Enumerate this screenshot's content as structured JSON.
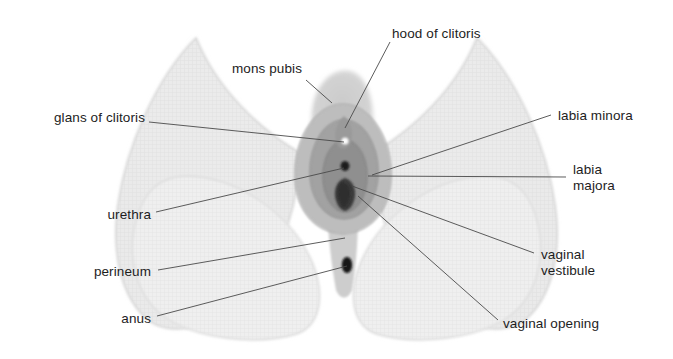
{
  "figure": {
    "width": 673,
    "height": 359,
    "background_color": "#ffffff",
    "text_color": "#1d1d1d",
    "leader_line_color": "#4a4a4a"
  },
  "palette": {
    "page_background": "#ffffff",
    "thigh_fill": "#e9e9e9",
    "thigh_edge": "#d2d2d2",
    "buttock_fill": "#ededed",
    "mons_fill": "#d0d0d0",
    "labia_majora_fill": "#bdbdbd",
    "labia_minora_fill": "#a2a2a2",
    "vestibule_fill": "#8f8f8f",
    "glans_fill": "#fbfbfb",
    "urethra_fill": "#1a1a1a",
    "vaginal_opening_fill": "#3a3a3a",
    "anus_fill": "#141414",
    "perineum_fill": "#c9c9c9"
  },
  "labels": [
    {
      "id": "glans-of-clitoris",
      "text": "glans of clitoris",
      "align": "right",
      "text_x": 35,
      "text_y": 110,
      "text_width": 110,
      "leader_from_x": 149,
      "leader_from_y": 122,
      "leader_to_x": 344,
      "leader_to_y": 142
    },
    {
      "id": "mons-pubis",
      "text": "mons pubis",
      "align": "right",
      "text_x": 222,
      "text_y": 61,
      "text_width": 80,
      "leader_from_x": 306,
      "leader_from_y": 80,
      "leader_to_x": 332,
      "leader_to_y": 103
    },
    {
      "id": "hood-of-clitoris",
      "text": "hood of clitoris",
      "align": "left",
      "text_x": 392,
      "text_y": 26,
      "text_width": 110,
      "leader_from_x": 390,
      "leader_from_y": 42,
      "leader_to_x": 345,
      "leader_to_y": 128
    },
    {
      "id": "labia-minora",
      "text": "labia minora",
      "align": "left",
      "text_x": 558,
      "text_y": 108,
      "text_width": 100,
      "leader_from_x": 551,
      "leader_from_y": 115,
      "leader_to_x": 372,
      "leader_to_y": 175
    },
    {
      "id": "labia-majora",
      "text": "labia\nmajora",
      "align": "left",
      "text_x": 573,
      "text_y": 162,
      "text_width": 90,
      "leader_from_x": 566,
      "leader_from_y": 177,
      "leader_to_x": 368,
      "leader_to_y": 176
    },
    {
      "id": "urethra",
      "text": "urethra",
      "align": "right",
      "text_x": 78,
      "text_y": 207,
      "text_width": 73,
      "leader_from_x": 156,
      "leader_from_y": 212,
      "leader_to_x": 344,
      "leader_to_y": 168
    },
    {
      "id": "perineum",
      "text": "perineum",
      "align": "right",
      "text_x": 78,
      "text_y": 264,
      "text_width": 73,
      "leader_from_x": 158,
      "leader_from_y": 270,
      "leader_to_x": 345,
      "leader_to_y": 238
    },
    {
      "id": "anus",
      "text": "anus",
      "align": "right",
      "text_x": 95,
      "text_y": 311,
      "text_width": 56,
      "leader_from_x": 157,
      "leader_from_y": 316,
      "leader_to_x": 347,
      "leader_to_y": 266
    },
    {
      "id": "vaginal-vestibule",
      "text": "vaginal\nvestibule",
      "align": "left",
      "text_x": 541,
      "text_y": 247,
      "text_width": 110,
      "leader_from_x": 534,
      "leader_from_y": 253,
      "leader_to_x": 352,
      "leader_to_y": 186
    },
    {
      "id": "vaginal-opening",
      "text": "vaginal opening",
      "align": "left",
      "text_x": 503,
      "text_y": 316,
      "text_width": 130,
      "leader_from_x": 498,
      "leader_from_y": 320,
      "leader_to_x": 358,
      "leader_to_y": 196
    }
  ],
  "structures": [
    {
      "id": "mons-pubis-region",
      "name": "mons pubis"
    },
    {
      "id": "labia-majora-region",
      "name": "labia majora"
    },
    {
      "id": "labia-minora-region",
      "name": "labia minora"
    },
    {
      "id": "vestibule-region",
      "name": "vaginal vestibule"
    },
    {
      "id": "clitoral-hood",
      "name": "hood of clitoris"
    },
    {
      "id": "glans-clitoris",
      "name": "glans of clitoris"
    },
    {
      "id": "urethral-opening",
      "name": "urethra"
    },
    {
      "id": "vaginal-opening",
      "name": "vaginal opening"
    },
    {
      "id": "perineum-region",
      "name": "perineum"
    },
    {
      "id": "anus-opening",
      "name": "anus"
    },
    {
      "id": "left-thigh",
      "name": "left thigh"
    },
    {
      "id": "right-thigh",
      "name": "right thigh"
    },
    {
      "id": "left-buttock",
      "name": "left buttock"
    },
    {
      "id": "right-buttock",
      "name": "right buttock"
    }
  ]
}
